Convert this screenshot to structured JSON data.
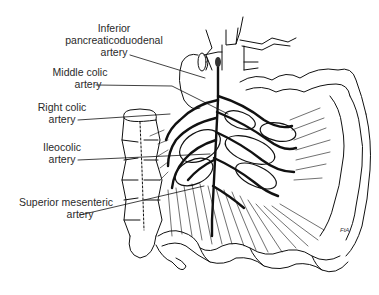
{
  "figure": {
    "labels": [
      {
        "id": "inferior-pancreaticoduodenal",
        "lines": [
          "Inferior",
          "pancreaticoduodenal",
          "artery"
        ]
      },
      {
        "id": "middle-colic",
        "lines": [
          "Middle colic",
          "artery"
        ]
      },
      {
        "id": "right-colic",
        "lines": [
          "Right colic",
          "artery"
        ]
      },
      {
        "id": "ileocolic",
        "lines": [
          "Ileocolic",
          "artery"
        ]
      },
      {
        "id": "superior-mesenteric",
        "lines": [
          "Superior mesenteric",
          "artery"
        ]
      }
    ],
    "signature": "FtA",
    "colors": {
      "ink": "#111111",
      "label_text": "#2a2a2a",
      "background": "#ffffff"
    }
  }
}
